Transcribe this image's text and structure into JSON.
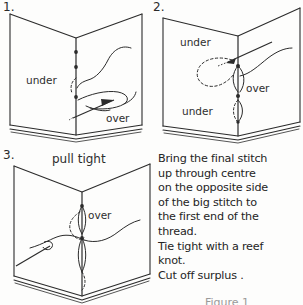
{
  "document": {
    "title": "Pamphlet stitch - final step",
    "type": "hand-drawn instructional diagram",
    "ink_color": "#2b2b2b",
    "paper_color": "#fdfdfc"
  },
  "panels": [
    {
      "number": "1.",
      "labels": [
        {
          "text": "under",
          "position": "left-page-middle"
        },
        {
          "text": "over",
          "position": "right-page-lower"
        }
      ]
    },
    {
      "number": "2.",
      "labels": [
        {
          "text": "under",
          "position": "left-page-upper"
        },
        {
          "text": "over",
          "position": "right-page-middle"
        },
        {
          "text": "under",
          "position": "left-page-lower"
        }
      ]
    },
    {
      "number": "3.",
      "caption": "pull tight",
      "labels": [
        {
          "text": "over",
          "position": "spine-upper"
        }
      ]
    }
  ],
  "instructions": {
    "lines": [
      "Bring the final stitch",
      "up through centre",
      "on the opposite side",
      "of the big stitch to",
      "the first end of the",
      "thread.",
      "Tie tight with a reef",
      "knot.",
      "Cut off surplus ."
    ]
  },
  "footer": {
    "partial_text": "Figure 1"
  }
}
